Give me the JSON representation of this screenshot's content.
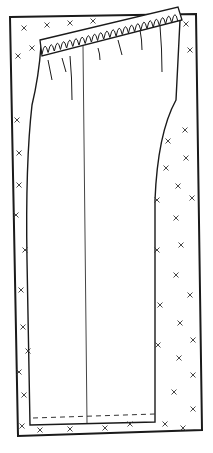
{
  "diagram": {
    "title": "",
    "colors": {
      "line": "#1a1a1a",
      "background": "#ffffff",
      "mark": "#333333"
    },
    "fabric_rect": {
      "points": "10,17 196,14 202,430 18,436"
    },
    "pattern_outline": "M41,46 C40,60 38,80 32,105 C28,140 26,200 27,260 L30,425 L155,422 L155,200 C157,150 165,120 176,100 L180,20 Z",
    "waistband": "M40,40 L178,7 L182,20 L42,56 Z",
    "grain_line": {
      "x1": 83,
      "y1": 46,
      "x2": 87,
      "y2": 423
    },
    "hem_line": {
      "x1": 33,
      "y1": 418,
      "x2": 155,
      "y2": 414
    },
    "x_marks": [
      [
        24,
        28
      ],
      [
        47,
        25
      ],
      [
        70,
        23
      ],
      [
        93,
        21
      ],
      [
        186,
        24
      ],
      [
        190,
        50
      ],
      [
        18,
        56
      ],
      [
        32,
        48
      ],
      [
        17,
        120
      ],
      [
        19,
        153
      ],
      [
        19,
        185
      ],
      [
        16,
        215
      ],
      [
        25,
        250
      ],
      [
        21,
        290
      ],
      [
        185,
        130
      ],
      [
        168,
        141
      ],
      [
        186,
        158
      ],
      [
        166,
        168
      ],
      [
        178,
        186
      ],
      [
        192,
        198
      ],
      [
        157,
        200
      ],
      [
        176,
        218
      ],
      [
        181,
        245
      ],
      [
        157,
        250
      ],
      [
        176,
        275
      ],
      [
        190,
        295
      ],
      [
        160,
        305
      ],
      [
        180,
        323
      ],
      [
        193,
        340
      ],
      [
        158,
        345
      ],
      [
        179,
        358
      ],
      [
        193,
        375
      ],
      [
        174,
        392
      ],
      [
        193,
        409
      ],
      [
        165,
        424
      ],
      [
        183,
        428
      ],
      [
        23,
        327
      ],
      [
        28,
        351
      ],
      [
        19,
        372
      ],
      [
        24,
        395
      ],
      [
        22,
        426
      ],
      [
        40,
        430
      ],
      [
        70,
        429
      ],
      [
        105,
        428
      ],
      [
        130,
        424
      ]
    ]
  }
}
